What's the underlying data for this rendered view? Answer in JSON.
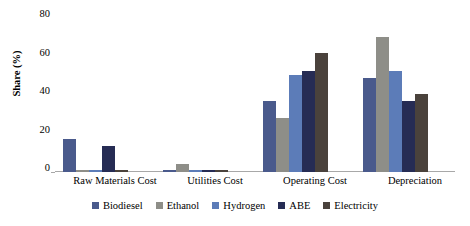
{
  "chart_data": {
    "type": "bar",
    "title": "",
    "subtitle": "",
    "xlabel": "",
    "ylabel": "Share (%)",
    "ylim": [
      0,
      80
    ],
    "yticks": [
      0,
      20,
      40,
      60,
      80
    ],
    "ytick_labels": [
      "0",
      "20",
      "40",
      "60",
      "80"
    ],
    "grid": false,
    "legend_position": "bottom",
    "categories": [
      "Raw Materials Cost",
      "Utilities Cost",
      "Operating Cost",
      "Depreciation"
    ],
    "series": [
      {
        "name": "Biodiesel",
        "color": "#4a5a8c",
        "values": [
          16.5,
          1.0,
          36.0,
          47.5
        ]
      },
      {
        "name": "Ethanol",
        "color": "#8e8e88",
        "values": [
          0.0,
          4.3,
          27.5,
          68.5
        ]
      },
      {
        "name": "Hydrogen",
        "color": "#5c7cb8",
        "values": [
          0.0,
          0.8,
          49.0,
          51.0
        ]
      },
      {
        "name": "ABE",
        "color": "#262c54",
        "values": [
          13.0,
          0.6,
          51.0,
          36.0
        ]
      },
      {
        "name": "Electricity",
        "color": "#4a423c",
        "values": [
          0.0,
          0.0,
          60.5,
          39.5
        ]
      }
    ]
  },
  "axis": {
    "y_title": "Share (%)",
    "tick_0": "0",
    "tick_20": "20",
    "tick_40": "40",
    "tick_60": "60",
    "tick_80": "80"
  },
  "x_axis": {
    "labels": [
      "Raw Materials Cost",
      "Utilities Cost",
      "Operating Cost",
      "Depreciation"
    ]
  },
  "legend": {
    "items": [
      {
        "label": "Biodiesel",
        "color": "#4a5a8c"
      },
      {
        "label": "Ethanol",
        "color": "#8e8e88"
      },
      {
        "label": "Hydrogen",
        "color": "#5c7cb8"
      },
      {
        "label": "ABE",
        "color": "#262c54"
      },
      {
        "label": "Electricity",
        "color": "#4a423c"
      }
    ]
  }
}
